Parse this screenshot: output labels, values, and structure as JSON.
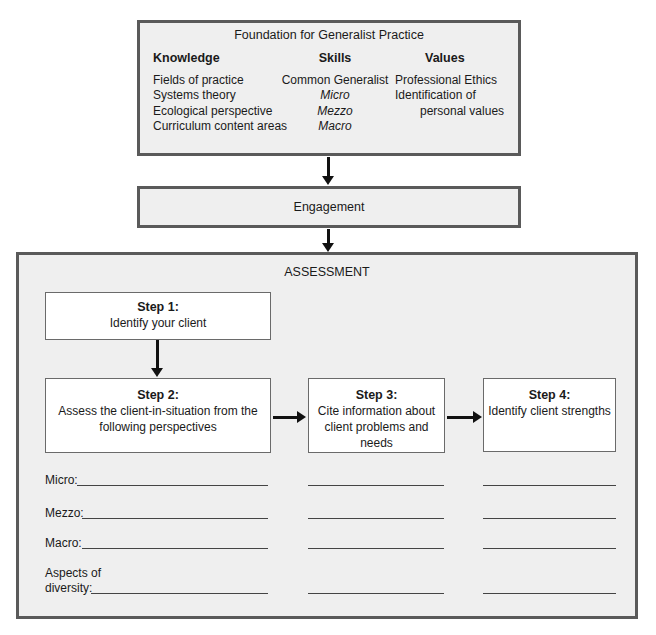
{
  "foundation": {
    "title": "Foundation for Generalist Practice",
    "knowledge": {
      "header": "Knowledge",
      "items": [
        "Fields of practice",
        "Systems theory",
        "Ecological perspective",
        "Curriculum content areas"
      ]
    },
    "skills": {
      "header": "Skills",
      "items": [
        "Common Generalist",
        "Micro",
        "Mezzo",
        "Macro"
      ]
    },
    "values": {
      "header": "Values",
      "items": [
        "Professional Ethics",
        "Identification of",
        "personal values"
      ]
    }
  },
  "engagement": {
    "label": "Engagement"
  },
  "assessment": {
    "title": "ASSESSMENT",
    "steps": [
      {
        "label": "Step 1:",
        "text": "Identify your client"
      },
      {
        "label": "Step 2:",
        "text": "Assess the client-in-situation from the following perspectives"
      },
      {
        "label": "Step 3:",
        "text": "Cite information about client problems and needs"
      },
      {
        "label": "Step 4:",
        "text": "Identify client strengths"
      }
    ],
    "perspectives": [
      {
        "label": "Micro:"
      },
      {
        "label": "Mezzo:"
      },
      {
        "label": "Macro:"
      },
      {
        "label_line1": "Aspects of",
        "label_line2": "diversity:"
      }
    ]
  },
  "colors": {
    "box_fill": "#efefef",
    "border": "#5a5a5a",
    "arrow": "#111111"
  }
}
